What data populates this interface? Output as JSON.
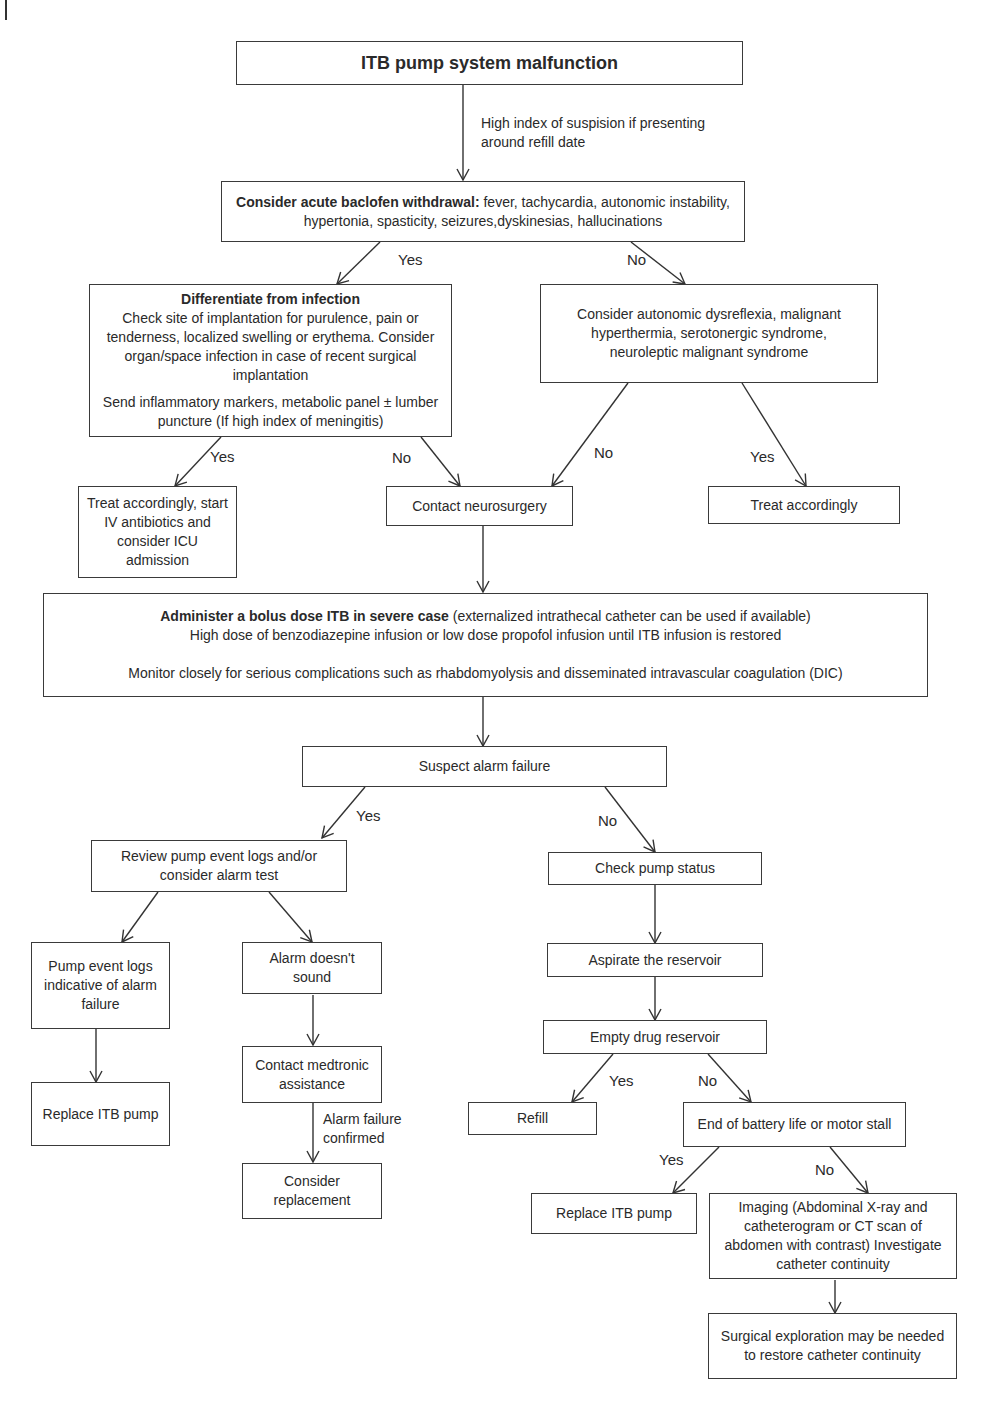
{
  "diagram": {
    "title": "ITB pump system malfunction",
    "refill_note": "High index of suspision if presenting around refill date",
    "withdrawal": {
      "bold": "Consider acute baclofen withdrawal:",
      "text": " fever, tachycardia, autonomic instability, hypertonia, spasticity, seizures,dyskinesias, hallucinations"
    },
    "infection": {
      "heading": "Differentiate from infection",
      "line1": "Check site of implantation for purulence, pain or tenderness, localized swelling or erythema. Consider organ/space infection in case of recent surgical implantation",
      "line2": "Send inflammatory markers, metabolic panel ± lumber puncture (If high index of meningitis)"
    },
    "differential": "Consider autonomic dysreflexia, malignant hyperthermia, serotonergic syndrome, neuroleptic malignant syndrome",
    "treat_infection": "Treat accordingly, start IV antibiotics and consider ICU admission",
    "contact_neurosurgery": "Contact neurosurgery",
    "treat_accordingly": "Treat accordingly",
    "bolus": {
      "bold": "Administer a bolus dose ITB in severe case",
      "text1": " (externalized intrathecal catheter can be used if available)",
      "line2": "High dose of benzodiazepine infusion or low dose propofol infusion until ITB infusion is restored",
      "line3": "Monitor closely for serious complications such as rhabdomyolysis and disseminated intravascular coagulation (DIC)"
    },
    "suspect_alarm": "Suspect alarm failure",
    "review_logs": "Review pump event logs and/or consider alarm test",
    "check_status": "Check pump status",
    "logs_indicative": "Pump event logs indicative of alarm failure",
    "alarm_no_sound": "Alarm doesn't sound",
    "aspirate": "Aspirate the reservoir",
    "contact_medtronic": "Contact medtronic assistance",
    "alarm_confirmed": "Alarm failure confirmed",
    "empty_reservoir": "Empty drug reservoir",
    "replace_itb_left": "Replace ITB pump",
    "consider_replacement": "Consider replacement",
    "refill": "Refill",
    "battery": "End of battery life or motor stall",
    "replace_itb_right": "Replace ITB pump",
    "imaging": "Imaging (Abdominal X-ray and catheterogram or CT scan of abdomen with contrast) Investigate catheter continuity",
    "surgical": "Surgical exploration may be needed to restore catheter continuity",
    "labels": {
      "yes": "Yes",
      "no": "No"
    }
  }
}
